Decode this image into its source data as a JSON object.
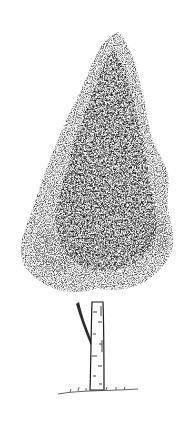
{
  "illustration": {
    "subject": "tree",
    "style": "pen-and-ink stipple",
    "colors": {
      "background": "#ffffff",
      "ink_dark": "#1a1a1a",
      "ink_mid": "#4a4a4a",
      "ink_light": "#8a8a8a"
    }
  }
}
